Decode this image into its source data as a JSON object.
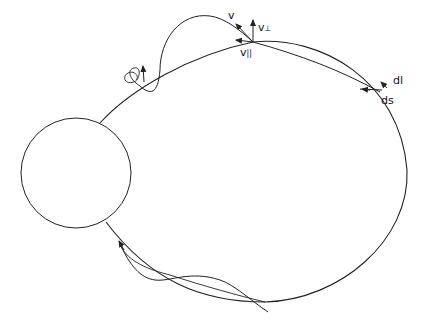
{
  "figure": {
    "labels": {
      "v": "v",
      "v_perp": "v",
      "v_perp_sub": "⊥",
      "v_par": "v",
      "v_par_sub": "||",
      "dl": "dl",
      "ds": "ds"
    },
    "colors": {
      "stroke": "#222222",
      "background": "#ffffff"
    }
  }
}
